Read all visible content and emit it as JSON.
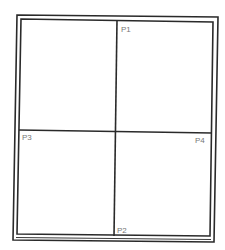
{
  "diagram": {
    "type": "window-frame-points",
    "labels": {
      "p1": "P1",
      "p2": "P2",
      "p3": "P3",
      "p4": "P4"
    },
    "colors": {
      "line": "#2a2a2a",
      "label": "#777777",
      "background": "#ffffff"
    }
  }
}
